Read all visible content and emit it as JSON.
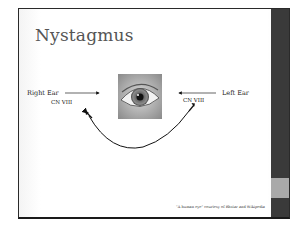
{
  "slide": {
    "title": "Nystagmus",
    "labels": {
      "right_ear": "Right Ear",
      "left_ear": "Left Ear",
      "cn_right": "CN VIII",
      "cn_left": "CN VIII"
    },
    "image": {
      "icon": "human-eye-photo"
    },
    "caption": "\"A human eye\" courtesy of Rhstar and Wikipedia"
  },
  "colors": {
    "sidebar": "#3a3a3a",
    "sidebar_accent": "#a9a9a9",
    "title": "#555555"
  }
}
